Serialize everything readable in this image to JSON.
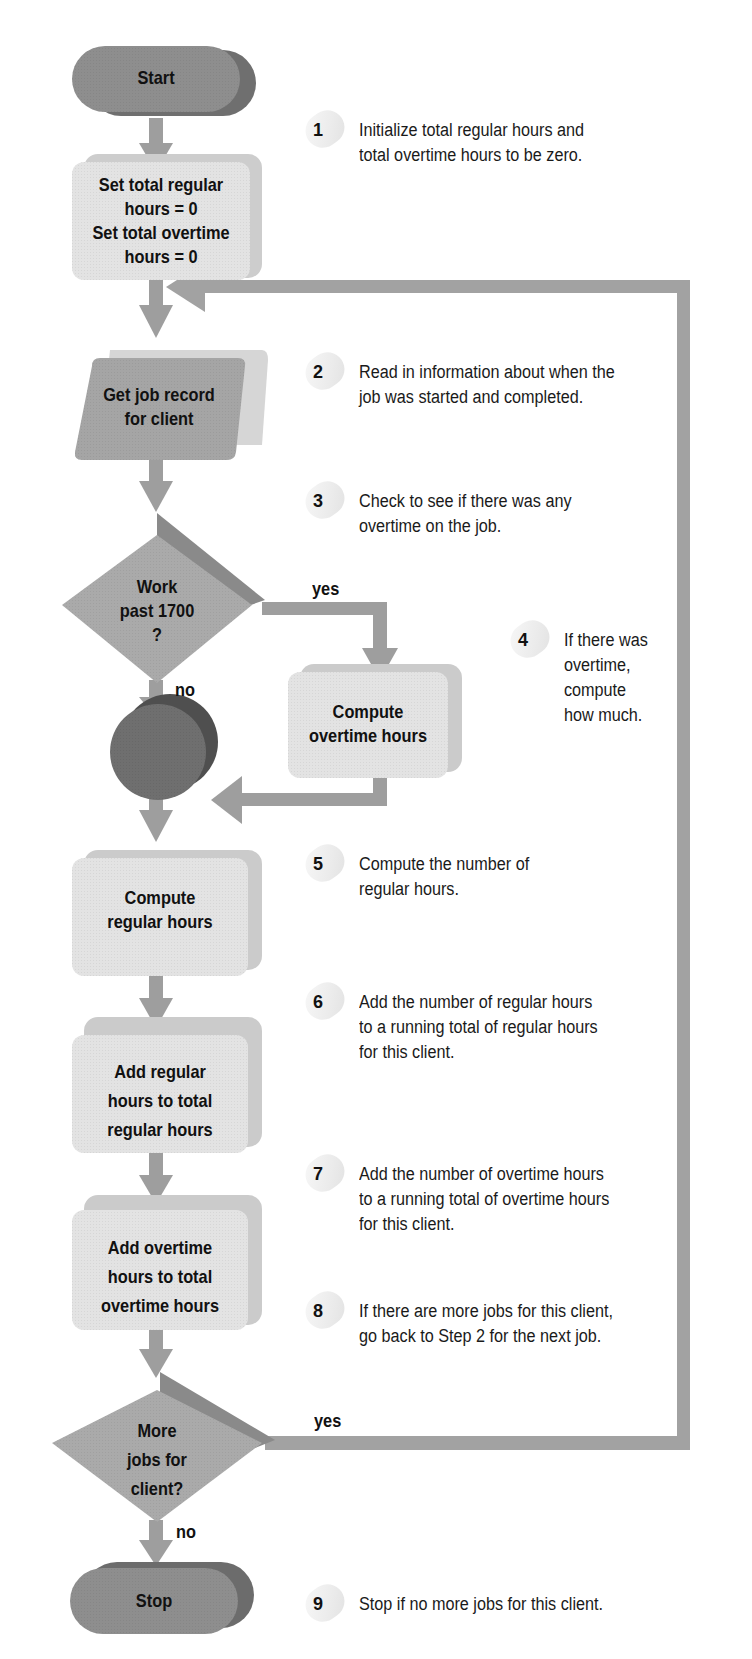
{
  "diagram": {
    "type": "flowchart",
    "colors": {
      "arrow": "#9a9a9a",
      "terminal": "#8c8c8c",
      "process": "#e2e2e2",
      "process_side": "#cfcfcf",
      "decision": "#a9a9a9",
      "decision_side": "#8a8a8a",
      "io": "#a8a8a8",
      "connector": "#6f6f6f",
      "connector_side": "#4d4d4d",
      "text": "#111111"
    },
    "nodes": {
      "start": {
        "label": "Start",
        "shape": "terminal"
      },
      "init": {
        "label_lines": [
          "Set total regular",
          "hours = 0",
          "Set total overtime",
          "hours = 0"
        ],
        "shape": "process"
      },
      "get_record": {
        "label_lines": [
          "Get job record",
          "for client"
        ],
        "shape": "input-output"
      },
      "work_past": {
        "label_lines": [
          "Work",
          "past 1700",
          "?"
        ],
        "shape": "decision"
      },
      "compute_overtime": {
        "label_lines": [
          "Compute",
          "overtime hours"
        ],
        "shape": "process"
      },
      "connector": {
        "label": "",
        "shape": "connector"
      },
      "compute_regular": {
        "label_lines": [
          "Compute",
          "regular hours"
        ],
        "shape": "process"
      },
      "add_regular": {
        "label_lines": [
          "Add regular",
          "hours to total",
          "regular hours"
        ],
        "shape": "process"
      },
      "add_overtime": {
        "label_lines": [
          "Add overtime",
          "hours to total",
          "overtime hours"
        ],
        "shape": "process"
      },
      "more_jobs": {
        "label_lines": [
          "More",
          "jobs for",
          "client?"
        ],
        "shape": "decision"
      },
      "stop": {
        "label": "Stop",
        "shape": "terminal"
      }
    },
    "edge_labels": {
      "work_past_yes": "yes",
      "work_past_no": "no",
      "more_jobs_yes": "yes",
      "more_jobs_no": "no"
    },
    "steps": [
      {
        "number": "1",
        "lines": [
          "Initialize total regular hours and",
          "total overtime hours to be zero."
        ]
      },
      {
        "number": "2",
        "lines": [
          "Read in information about when the",
          "job was started and completed."
        ]
      },
      {
        "number": "3",
        "lines": [
          "Check to see if there was any",
          "overtime on the job."
        ]
      },
      {
        "number": "4",
        "lines": [
          "If there was",
          "overtime,",
          "compute",
          "how much."
        ]
      },
      {
        "number": "5",
        "lines": [
          "Compute the number of",
          "regular hours."
        ]
      },
      {
        "number": "6",
        "lines": [
          "Add the number of regular hours",
          "to a running total of regular hours",
          "for this client."
        ]
      },
      {
        "number": "7",
        "lines": [
          "Add the number of overtime hours",
          "to a running total of overtime hours",
          "for this client."
        ]
      },
      {
        "number": "8",
        "lines": [
          "If there are more jobs for this client,",
          "go back to Step 2 for the next job."
        ]
      },
      {
        "number": "9",
        "lines": [
          "Stop if no more jobs for this client."
        ]
      }
    ]
  }
}
